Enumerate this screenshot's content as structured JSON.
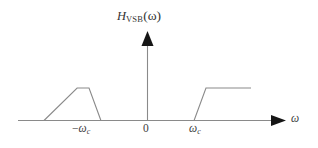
{
  "figure": {
    "title": {
      "function_name": "H",
      "subscript": "VSB",
      "argument": "(ω)",
      "full": "H_VSB(ω)"
    },
    "axes": {
      "x_axis_label": "ω",
      "y_axis_label": "H_VSB(ω)",
      "origin_label": "0",
      "tick_labels": [
        {
          "text_minus": "−",
          "text_omega": "ω",
          "text_sub": "c",
          "full": "−ωc"
        },
        {
          "full": "0"
        },
        {
          "text_omega": "ω",
          "text_sub": "c",
          "full": "ωc"
        }
      ]
    },
    "colors": {
      "stroke": "#8a8a8a",
      "axis": "#7d7d7d",
      "arrowhead": "#111111",
      "text": "#3d3d3d",
      "background": "#ffffff"
    }
  },
  "chart_data": {
    "type": "line",
    "xlabel": "ω",
    "ylabel": "H_VSB(ω)",
    "grid": false,
    "legend": null,
    "xlim": [
      -1.45,
      1.45
    ],
    "ylim": [
      0,
      1.25
    ],
    "xticks": [
      -1,
      0,
      1
    ],
    "xticklabels": [
      "−ωc",
      "0",
      "ωc"
    ],
    "series": [
      {
        "name": "H_VSB(ω) lower sideband",
        "x": [
          -1.45,
          -1.0,
          -0.68,
          -0.565,
          -0.45
        ],
        "y": [
          0,
          0,
          1.0,
          1.0,
          0
        ]
      },
      {
        "name": "H_VSB(ω) upper sideband",
        "x": [
          0.45,
          0.565,
          0.68,
          1.0,
          1.45
        ],
        "y": [
          0,
          1.0,
          1.0,
          1.0,
          0
        ]
      }
    ],
    "annotations": [
      {
        "text": "−ωc",
        "x": -1.0,
        "y": 0
      },
      {
        "text": "0",
        "x": 0,
        "y": 0
      },
      {
        "text": "ωc",
        "x": 1.0,
        "y": 0
      }
    ]
  }
}
